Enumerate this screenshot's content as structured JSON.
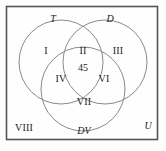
{
  "figure": {
    "type": "venn-diagram-3-set",
    "universe_label": "U",
    "border_color": "#555555",
    "circle_color": "#8a8a8a",
    "text_color": "#1a1a1a",
    "background": "#fefefe"
  },
  "sets": [
    {
      "id": "set-t",
      "label": "T",
      "position": "top-left"
    },
    {
      "id": "set-d",
      "label": "D",
      "position": "top-right"
    },
    {
      "id": "set-dv",
      "label": "DV",
      "position": "bottom"
    }
  ],
  "regions": [
    {
      "id": "region-1",
      "label": "I",
      "description": "T only"
    },
    {
      "id": "region-2",
      "label": "II",
      "description": "T and D only"
    },
    {
      "id": "region-3",
      "label": "III",
      "description": "D only"
    },
    {
      "id": "region-4",
      "label": "IV",
      "description": "T and DV only"
    },
    {
      "id": "region-5",
      "label": "45",
      "description": "T and D and DV"
    },
    {
      "id": "region-6",
      "label": "VI",
      "description": "D and DV only"
    },
    {
      "id": "region-7",
      "label": "VII",
      "description": "DV only"
    },
    {
      "id": "region-8",
      "label": "VIII",
      "description": "outside all sets"
    }
  ]
}
